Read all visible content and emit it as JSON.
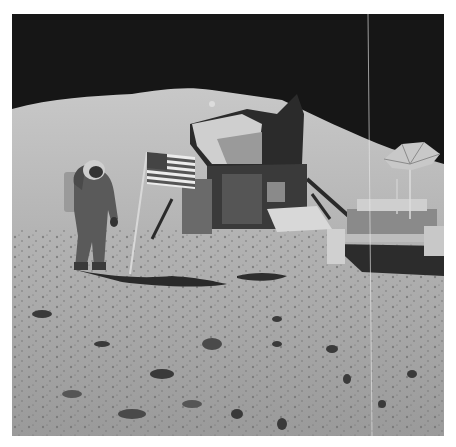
{
  "image": {
    "kind": "photograph",
    "subject": "astronaut saluting flag beside lunar module and lunar roving vehicle on the lunar surface",
    "colors": {
      "sky": "#161616",
      "mountain": "#bdbdbd",
      "ground": "#a8a8a8",
      "shadow": "#2a2a2a",
      "module_dark": "#2b2b2b",
      "module_light": "#d0d0d0"
    },
    "elements": [
      {
        "name": "black-sky"
      },
      {
        "name": "mountain-slope"
      },
      {
        "name": "astronaut"
      },
      {
        "name": "american-flag"
      },
      {
        "name": "lunar-module"
      },
      {
        "name": "lunar-rover"
      },
      {
        "name": "high-gain-antenna"
      },
      {
        "name": "regolith-ground"
      }
    ]
  }
}
